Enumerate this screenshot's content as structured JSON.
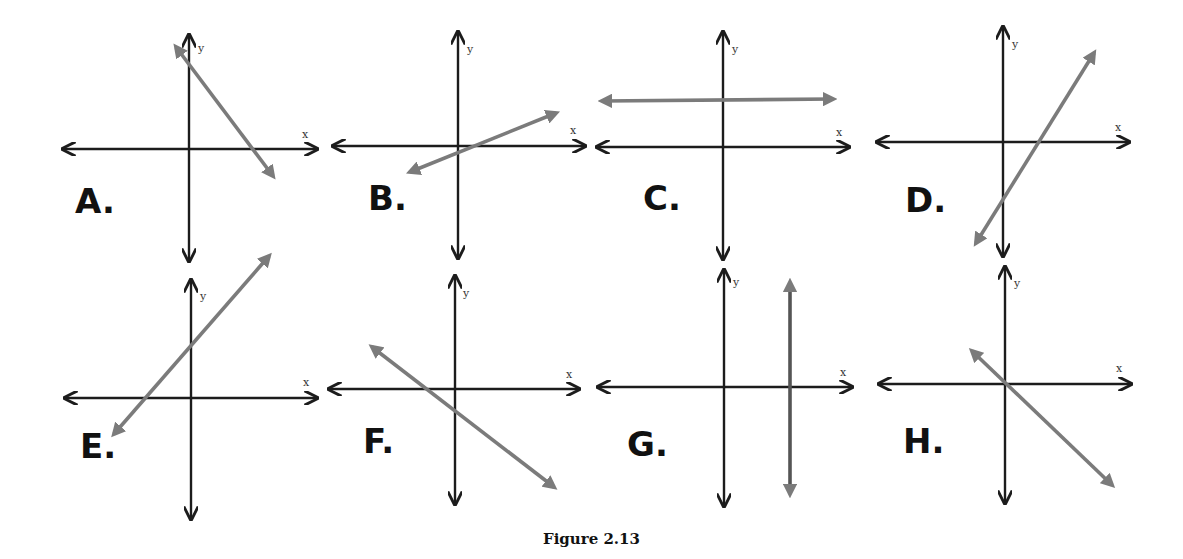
{
  "figure": {
    "caption": "Figure 2.13",
    "axis_color": "#1c1c1c",
    "line_color": "#7b7b7b",
    "axis_labels": {
      "x": "x",
      "y": "y"
    }
  },
  "panels": [
    {
      "id": "A",
      "label": "A.",
      "description": "negative slope, positive y-intercept, positive x-intercept"
    },
    {
      "id": "B",
      "label": "B.",
      "description": "small positive slope, passes near origin slightly below"
    },
    {
      "id": "C",
      "label": "C.",
      "description": "horizontal line above x-axis (zero slope, positive y-intercept)"
    },
    {
      "id": "D",
      "label": "D.",
      "description": "steep positive slope, negative y-intercept, positive x-intercept"
    },
    {
      "id": "E",
      "label": "E.",
      "description": "positive slope, positive y-intercept, negative x-intercept"
    },
    {
      "id": "F",
      "label": "F.",
      "description": "negative slope, negative y-intercept, negative x-intercept"
    },
    {
      "id": "G",
      "label": "G.",
      "description": "vertical line right of y-axis (undefined slope, positive x-intercept)"
    },
    {
      "id": "H",
      "label": "H.",
      "description": "negative slope, passes through origin"
    }
  ]
}
